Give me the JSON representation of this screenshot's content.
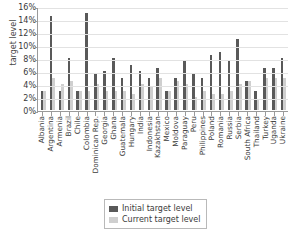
{
  "chart_data": {
    "type": "bar",
    "title": "",
    "xlabel": "",
    "ylabel": "target level",
    "ylim": [
      0,
      16
    ],
    "ytick_labels": [
      "0%",
      "2%",
      "4%",
      "6%",
      "8%",
      "10%",
      "12%",
      "14%",
      "16%"
    ],
    "ytick_values": [
      0,
      2,
      4,
      6,
      8,
      10,
      12,
      14,
      16
    ],
    "grid": true,
    "legend_position": "bottom",
    "value_suffix": "%",
    "categories": [
      "Albania",
      "Argentina",
      "Armenia",
      "Brazil",
      "Chile",
      "Colombia",
      "Dominican Rep.",
      "Georgia",
      "Ghana",
      "Guatemala",
      "Hungary",
      "India",
      "Indonesia",
      "Kazakhstan",
      "Mexico",
      "Moldova",
      "Paraguay",
      "Peru",
      "Philippines",
      "Poland",
      "Romania",
      "Russia",
      "Serbia",
      "South Africa",
      "Thailand",
      "Turkey",
      "Uganda",
      "Ukraine"
    ],
    "series": [
      {
        "name": "Initial target level",
        "color": "#595959",
        "values": [
          3.0,
          14.5,
          3.0,
          8.0,
          3.0,
          15.0,
          5.5,
          6.0,
          8.0,
          5.0,
          7.0,
          6.0,
          5.0,
          6.5,
          3.0,
          5.0,
          7.5,
          5.5,
          5.0,
          8.5,
          9.0,
          7.5,
          11.0,
          4.5,
          3.0,
          6.5,
          6.5,
          8.0
        ]
      },
      {
        "name": "Current target level",
        "color": "#cfcfcf",
        "values": [
          3.0,
          5.0,
          4.0,
          4.5,
          3.0,
          3.0,
          4.0,
          3.0,
          3.0,
          3.0,
          2.5,
          4.0,
          3.5,
          5.0,
          3.0,
          4.5,
          4.0,
          2.0,
          3.0,
          2.5,
          2.5,
          3.0,
          4.0,
          4.5,
          1.5,
          5.0,
          5.0,
          5.0
        ]
      }
    ]
  },
  "legend": {
    "items": [
      {
        "label": "Initial target level"
      },
      {
        "label": "Current target level"
      }
    ]
  }
}
